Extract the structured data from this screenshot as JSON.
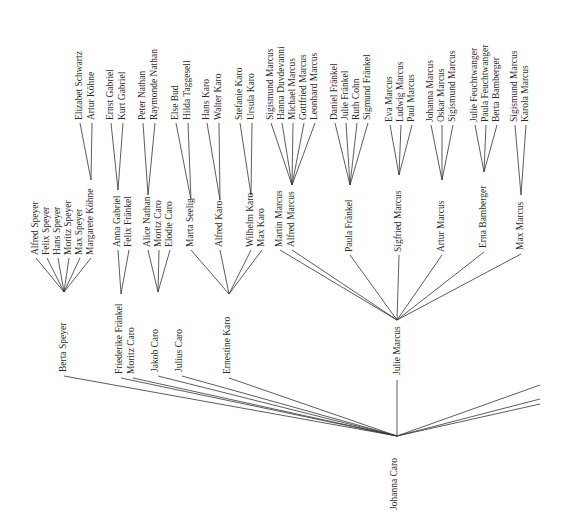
{
  "diagram": {
    "type": "family-tree",
    "root": "Johanna Caro",
    "nodes": [
      {
        "id": "johanna",
        "label": "Johanna Caro",
        "x": 397,
        "y": 510,
        "anchor": "start",
        "px": 397,
        "py": 436
      },
      {
        "id": "berta",
        "label": "Berta Speyer",
        "x": 66,
        "y": 372,
        "px": 64,
        "py": 376
      },
      {
        "id": "friederike",
        "label": "Friederike Fränkel",
        "x": 122,
        "y": 374,
        "px": 121,
        "py": 378
      },
      {
        "id": "moritz",
        "label": "Moritz Caro",
        "x": 134,
        "y": 374,
        "px": 133,
        "py": 378
      },
      {
        "id": "jakob",
        "label": "Jakob Caro",
        "x": 158,
        "y": 372,
        "px": 158,
        "py": 376
      },
      {
        "id": "julius",
        "label": "Julius Caro",
        "x": 182,
        "y": 372,
        "px": 182,
        "py": 376
      },
      {
        "id": "ernestine",
        "label": "Ernestine Karo",
        "x": 230,
        "y": 374,
        "px": 229,
        "py": 378
      },
      {
        "id": "julie",
        "label": "Julie Marcus",
        "x": 400,
        "y": 375,
        "px": 397,
        "py": 380,
        "topy": 320
      },
      {
        "id": "alfred_s",
        "label": "Alfred Speyer",
        "x": 38,
        "y": 255,
        "px": 36,
        "py": 258
      },
      {
        "id": "felix_s",
        "label": "Felix Speyer",
        "x": 49,
        "y": 255,
        "px": 47,
        "py": 258
      },
      {
        "id": "hans_s",
        "label": "Hans Speyer",
        "x": 60,
        "y": 255,
        "px": 58,
        "py": 258
      },
      {
        "id": "moritz_s",
        "label": "Moritz Speyer",
        "x": 71,
        "y": 255,
        "px": 69,
        "py": 258
      },
      {
        "id": "max_s",
        "label": "Max Speyer",
        "x": 82,
        "y": 255,
        "px": 80,
        "py": 258
      },
      {
        "id": "margarete",
        "label": "Margarete Köhne",
        "x": 93,
        "y": 255,
        "px": 91,
        "py": 258,
        "topy": 180
      },
      {
        "id": "anna",
        "label": "Anna Gabriel",
        "x": 120,
        "y": 247,
        "px": 118,
        "py": 250,
        "topy": 190
      },
      {
        "id": "felix_f",
        "label": "Felix Fränkel",
        "x": 131,
        "y": 247,
        "px": 129,
        "py": 250
      },
      {
        "id": "alice",
        "label": "Alice Nathan",
        "x": 150,
        "y": 247,
        "px": 148,
        "py": 250,
        "topy": 195
      },
      {
        "id": "moritz_c",
        "label": "Moritz Caro",
        "x": 161,
        "y": 247,
        "px": 159,
        "py": 250
      },
      {
        "id": "elodie",
        "label": "Elodie Caro",
        "x": 172,
        "y": 247,
        "px": 170,
        "py": 250
      },
      {
        "id": "marta",
        "label": "Marta Seelig",
        "x": 193,
        "y": 247,
        "px": 191,
        "py": 250,
        "topy": 200
      },
      {
        "id": "alfred_k",
        "label": "Alfred Karo",
        "x": 222,
        "y": 247,
        "px": 220,
        "py": 250,
        "topy": 200
      },
      {
        "id": "wilhelm",
        "label": "Wilhelm Karo",
        "x": 253,
        "y": 247,
        "px": 251,
        "py": 250,
        "topy": 195
      },
      {
        "id": "max_k",
        "label": "Max Karo",
        "x": 264,
        "y": 247,
        "px": 262,
        "py": 250
      },
      {
        "id": "martin",
        "label": "Martin Marcus",
        "x": 282,
        "y": 247,
        "px": 280,
        "py": 250
      },
      {
        "id": "alfred_m",
        "label": "Alfred Marcus",
        "x": 294,
        "y": 247,
        "px": 292,
        "py": 250,
        "topy": 185
      },
      {
        "id": "paula",
        "label": "Paula Fränkel",
        "x": 352,
        "y": 252,
        "px": 350,
        "py": 255,
        "topy": 185
      },
      {
        "id": "sigfried",
        "label": "Sigfried Marcus",
        "x": 401,
        "y": 252,
        "px": 399,
        "py": 255,
        "topy": 175
      },
      {
        "id": "artur",
        "label": "Artur Marcus",
        "x": 444,
        "y": 252,
        "px": 442,
        "py": 255,
        "topy": 180
      },
      {
        "id": "erna",
        "label": "Erna Bamberger",
        "x": 486,
        "y": 248,
        "px": 484,
        "py": 252,
        "topy": 172
      },
      {
        "id": "max_m",
        "label": "Max Marcus",
        "x": 523,
        "y": 250,
        "px": 521,
        "py": 254,
        "topy": 195
      },
      {
        "id": "elizabet",
        "label": "Elizabet Schwartz",
        "x": 82,
        "y": 120,
        "px": 80,
        "py": 123
      },
      {
        "id": "artur_k",
        "label": "Artur Köhne",
        "x": 94,
        "y": 120,
        "px": 92,
        "py": 123
      },
      {
        "id": "ernst",
        "label": "Ernst Gabriel",
        "x": 113,
        "y": 120,
        "px": 111,
        "py": 123
      },
      {
        "id": "kurt",
        "label": "Kurt Gabriel",
        "x": 125,
        "y": 120,
        "px": 123,
        "py": 123
      },
      {
        "id": "peter",
        "label": "Peter Nathan",
        "x": 145,
        "y": 120,
        "px": 143,
        "py": 123
      },
      {
        "id": "raymonde",
        "label": "Raymonde Nathan",
        "x": 157,
        "y": 120,
        "px": 155,
        "py": 123
      },
      {
        "id": "else",
        "label": "Else Bud",
        "x": 178,
        "y": 120,
        "px": 176,
        "py": 123
      },
      {
        "id": "hilda",
        "label": "Hilda Taggesell",
        "x": 190,
        "y": 120,
        "px": 188,
        "py": 123
      },
      {
        "id": "hans_k",
        "label": "Hans Karo",
        "x": 209,
        "y": 120,
        "px": 207,
        "py": 123
      },
      {
        "id": "walter",
        "label": "Walter Karo",
        "x": 221,
        "y": 120,
        "px": 219,
        "py": 123
      },
      {
        "id": "stefanie",
        "label": "Stefanie Karo",
        "x": 242,
        "y": 120,
        "px": 240,
        "py": 123
      },
      {
        "id": "ursula",
        "label": "Ursula Karo",
        "x": 254,
        "y": 120,
        "px": 252,
        "py": 123
      },
      {
        "id": "sigmund_m1",
        "label": "Sigismund Marcus",
        "x": 273,
        "y": 120,
        "px": 271,
        "py": 123
      },
      {
        "id": "hanna",
        "label": "Hanna Duvdevanni",
        "x": 284,
        "y": 120,
        "px": 282,
        "py": 123
      },
      {
        "id": "michael",
        "label": "Michael Marcus",
        "x": 295,
        "y": 120,
        "px": 293,
        "py": 123
      },
      {
        "id": "gottfried",
        "label": "Gottfried Marcus",
        "x": 306,
        "y": 120,
        "px": 304,
        "py": 123
      },
      {
        "id": "leonhard",
        "label": "Leonhard Marcus",
        "x": 317,
        "y": 120,
        "px": 315,
        "py": 123
      },
      {
        "id": "daniel",
        "label": "Daniel Fränkel",
        "x": 337,
        "y": 120,
        "px": 335,
        "py": 123
      },
      {
        "id": "julie_f",
        "label": "Julie Fränkel",
        "x": 348,
        "y": 120,
        "px": 346,
        "py": 123
      },
      {
        "id": "ruth",
        "label": "Ruth Cohn",
        "x": 359,
        "y": 120,
        "px": 357,
        "py": 123
      },
      {
        "id": "sigmund_f",
        "label": "Sigmund Fränkel",
        "x": 370,
        "y": 120,
        "px": 368,
        "py": 123
      },
      {
        "id": "eva",
        "label": "Eva Marcus",
        "x": 392,
        "y": 122,
        "px": 390,
        "py": 125
      },
      {
        "id": "ludwig",
        "label": "Ludwig Marcus",
        "x": 403,
        "y": 122,
        "px": 401,
        "py": 125
      },
      {
        "id": "paul",
        "label": "Paul Marcus",
        "x": 414,
        "y": 122,
        "px": 412,
        "py": 125
      },
      {
        "id": "johanna_m",
        "label": "Johanna Marcus",
        "x": 433,
        "y": 122,
        "px": 431,
        "py": 125
      },
      {
        "id": "oskar",
        "label": "Oskar Marcus",
        "x": 444,
        "y": 122,
        "px": 442,
        "py": 125
      },
      {
        "id": "sigismund_m2",
        "label": "Sigismund Marcus",
        "x": 455,
        "y": 122,
        "px": 453,
        "py": 125
      },
      {
        "id": "julie_fe",
        "label": "Julie Feuchtwanger",
        "x": 477,
        "y": 122,
        "px": 475,
        "py": 125
      },
      {
        "id": "paula_fe",
        "label": "Paula Feuchtwanger",
        "x": 488,
        "y": 122,
        "px": 486,
        "py": 125
      },
      {
        "id": "berta_b",
        "label": "Berta Bamberger",
        "x": 499,
        "y": 122,
        "px": 497,
        "py": 125
      },
      {
        "id": "sigismund_m3",
        "label": "Sigismund Marcus",
        "x": 517,
        "y": 122,
        "px": 515,
        "py": 125
      },
      {
        "id": "karola",
        "label": "Karola Marcus",
        "x": 528,
        "y": 122,
        "px": 526,
        "py": 125
      }
    ],
    "edges": [
      [
        "johanna",
        "berta"
      ],
      [
        "johanna",
        "friederike"
      ],
      [
        "johanna",
        "moritz"
      ],
      [
        "johanna",
        "jakob"
      ],
      [
        "johanna",
        "julius"
      ],
      [
        "johanna",
        "ernestine"
      ],
      [
        "johanna",
        "julie"
      ],
      [
        "berta",
        "alfred_s"
      ],
      [
        "berta",
        "felix_s"
      ],
      [
        "berta",
        "hans_s"
      ],
      [
        "berta",
        "moritz_s"
      ],
      [
        "berta",
        "max_s"
      ],
      [
        "berta",
        "margarete"
      ],
      [
        "friederike",
        "anna"
      ],
      [
        "friederike",
        "felix_f"
      ],
      [
        "jakob",
        "alice"
      ],
      [
        "jakob",
        "moritz_c"
      ],
      [
        "jakob",
        "elodie"
      ],
      [
        "ernestine",
        "marta"
      ],
      [
        "ernestine",
        "alfred_k"
      ],
      [
        "ernestine",
        "wilhelm"
      ],
      [
        "ernestine",
        "max_k"
      ],
      [
        "julie",
        "martin"
      ],
      [
        "julie",
        "alfred_m"
      ],
      [
        "julie",
        "paula"
      ],
      [
        "julie",
        "sigfried"
      ],
      [
        "julie",
        "artur"
      ],
      [
        "julie",
        "erna"
      ],
      [
        "julie",
        "max_m"
      ],
      [
        "margarete",
        "elizabet"
      ],
      [
        "margarete",
        "artur_k"
      ],
      [
        "anna",
        "ernst"
      ],
      [
        "anna",
        "kurt"
      ],
      [
        "alice",
        "peter"
      ],
      [
        "alice",
        "raymonde"
      ],
      [
        "marta",
        "else"
      ],
      [
        "marta",
        "hilda"
      ],
      [
        "alfred_k",
        "hans_k"
      ],
      [
        "alfred_k",
        "walter"
      ],
      [
        "wilhelm",
        "stefanie"
      ],
      [
        "wilhelm",
        "ursula"
      ],
      [
        "alfred_m",
        "sigmund_m1"
      ],
      [
        "alfred_m",
        "hanna"
      ],
      [
        "alfred_m",
        "michael"
      ],
      [
        "alfred_m",
        "gottfried"
      ],
      [
        "alfred_m",
        "leonhard"
      ],
      [
        "paula",
        "daniel"
      ],
      [
        "paula",
        "julie_f"
      ],
      [
        "paula",
        "ruth"
      ],
      [
        "paula",
        "sigmund_f"
      ],
      [
        "sigfried",
        "eva"
      ],
      [
        "sigfried",
        "ludwig"
      ],
      [
        "sigfried",
        "paul"
      ],
      [
        "artur",
        "johanna_m"
      ],
      [
        "artur",
        "oskar"
      ],
      [
        "artur",
        "sigismund_m2"
      ],
      [
        "erna",
        "julie_fe"
      ],
      [
        "erna",
        "paula_fe"
      ],
      [
        "erna",
        "berta_b"
      ],
      [
        "max_m",
        "sigismund_m3"
      ],
      [
        "max_m",
        "karola"
      ]
    ],
    "offpage_lines": [
      [
        540,
        385
      ],
      [
        540,
        399
      ],
      [
        540,
        404
      ]
    ]
  }
}
